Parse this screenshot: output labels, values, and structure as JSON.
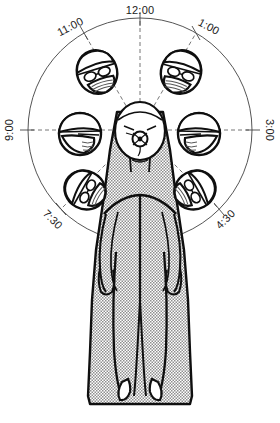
{
  "clock": {
    "center_label": "operative-eye-target",
    "positions": [
      {
        "id": "p12",
        "label": "12:00",
        "angle_deg": 0,
        "has_head": false,
        "has_spoke": true,
        "label_rotation": 0
      },
      {
        "id": "p1",
        "label": "1:00",
        "angle_deg": 30,
        "has_head": true,
        "has_spoke": true,
        "label_rotation": 30
      },
      {
        "id": "p3",
        "label": "3:00",
        "angle_deg": 90,
        "has_head": true,
        "has_spoke": true,
        "label_rotation": 90
      },
      {
        "id": "p430",
        "label": "4:30",
        "angle_deg": 135,
        "has_head": true,
        "has_spoke": true,
        "label_rotation": 135
      },
      {
        "id": "p730",
        "label": "7:30",
        "angle_deg": 225,
        "has_head": true,
        "has_spoke": true,
        "label_rotation": -135
      },
      {
        "id": "p9",
        "label": "9:00",
        "angle_deg": 270,
        "has_head": true,
        "has_spoke": true,
        "label_rotation": -90
      },
      {
        "id": "p11",
        "label": "11:00",
        "angle_deg": 330,
        "has_head": true,
        "has_spoke": true,
        "label_rotation": -30
      }
    ],
    "heads": [
      {
        "id": "head-11",
        "station": "11:00",
        "orientation": "three-quarter-facing-down-right",
        "wears": [
          "surgical-cap",
          "eyeglasses",
          "face-mask"
        ]
      },
      {
        "id": "head-1",
        "station": "1:00",
        "orientation": "three-quarter-facing-down-left",
        "wears": [
          "surgical-cap",
          "eyeglasses",
          "face-mask"
        ]
      },
      {
        "id": "head-9",
        "station": "9:00",
        "orientation": "profile-facing-right",
        "wears": [
          "surgical-cap",
          "eyeglasses",
          "face-mask"
        ]
      },
      {
        "id": "head-3",
        "station": "3:00",
        "orientation": "profile-facing-left",
        "wears": [
          "surgical-cap",
          "eyeglasses",
          "face-mask"
        ]
      },
      {
        "id": "head-730",
        "station": "7:30",
        "orientation": "tilted-facing-up-right",
        "wears": [
          "surgical-cap",
          "eyeglasses",
          "face-mask"
        ]
      },
      {
        "id": "head-430",
        "station": "4:30",
        "orientation": "tilted-facing-up-left",
        "wears": [
          "surgical-cap",
          "eyeglasses",
          "face-mask"
        ]
      }
    ]
  },
  "patient": {
    "pose": "supine",
    "covering": "surgical-drape",
    "drape_fill": "stippled-halftone",
    "visible_parts": [
      "head",
      "face",
      "neck",
      "torso",
      "arms",
      "hands",
      "legs",
      "feet"
    ]
  },
  "colors": {
    "ink": "#111111",
    "line": "#3d3d3d",
    "paper": "#ffffff",
    "drape_stipple": "#9a9a9a",
    "drape_base": "#ffffff"
  }
}
